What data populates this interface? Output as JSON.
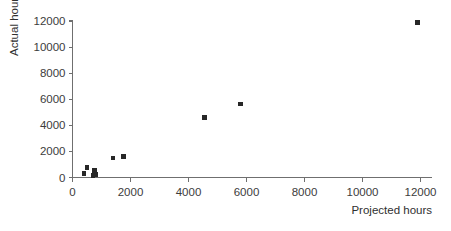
{
  "chart_data": {
    "type": "scatter",
    "title": "",
    "xlabel": "Projected hours",
    "ylabel": "Actual hours",
    "xlim": [
      0,
      12600
    ],
    "ylim": [
      0,
      12600
    ],
    "xticks": [
      0,
      2000,
      4000,
      6000,
      8000,
      10000,
      12000
    ],
    "yticks": [
      0,
      2000,
      4000,
      6000,
      8000,
      10000,
      12000
    ],
    "xtick_labels": [
      "0",
      "2000",
      "4000",
      "6000",
      "8000",
      "10000",
      "12000"
    ],
    "ytick_labels": [
      "0",
      "2000",
      "4000",
      "6000",
      "8000",
      "10000",
      "12000"
    ],
    "grid": false,
    "legend": false,
    "marker": "square",
    "marker_color": "#272727",
    "axis_color": "#6f6f6f",
    "background": "#ffffff",
    "series": [
      {
        "name": "Projects",
        "points": [
          {
            "x": 400,
            "y": 300
          },
          {
            "x": 500,
            "y": 750
          },
          {
            "x": 700,
            "y": 150
          },
          {
            "x": 750,
            "y": 550
          },
          {
            "x": 800,
            "y": 250
          },
          {
            "x": 1400,
            "y": 1500
          },
          {
            "x": 1750,
            "y": 1600
          },
          {
            "x": 4550,
            "y": 4600
          },
          {
            "x": 5800,
            "y": 5650
          },
          {
            "x": 11900,
            "y": 11900
          }
        ]
      }
    ]
  }
}
